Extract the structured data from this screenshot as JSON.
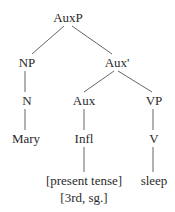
{
  "tree": {
    "nodes": [
      {
        "id": "auxp",
        "label": "AuxP",
        "x": 68,
        "y": 10
      },
      {
        "id": "np",
        "label": "NP",
        "x": 27,
        "y": 55
      },
      {
        "id": "auxbar",
        "label": "Aux'",
        "x": 117,
        "y": 55
      },
      {
        "id": "n",
        "label": "N",
        "x": 27,
        "y": 93
      },
      {
        "id": "aux",
        "label": "Aux",
        "x": 84,
        "y": 93
      },
      {
        "id": "vp",
        "label": "VP",
        "x": 154,
        "y": 93
      },
      {
        "id": "mary",
        "label": "Mary",
        "x": 26,
        "y": 131
      },
      {
        "id": "infl",
        "label": "Infl",
        "x": 84,
        "y": 131
      },
      {
        "id": "v",
        "label": "V",
        "x": 154,
        "y": 131
      },
      {
        "id": "tense",
        "label": "[present tense]",
        "x": 84,
        "y": 173
      },
      {
        "id": "agr",
        "label": "[3rd, sg.]",
        "x": 84,
        "y": 190
      },
      {
        "id": "sleep",
        "label": "sleep",
        "x": 154,
        "y": 173
      }
    ],
    "edges": [
      {
        "from": "auxp",
        "to": "np",
        "x1": 64,
        "y1": 26,
        "x2": 32,
        "y2": 54
      },
      {
        "from": "auxp",
        "to": "auxbar",
        "x1": 72,
        "y1": 26,
        "x2": 112,
        "y2": 54
      },
      {
        "from": "np",
        "to": "n",
        "x1": 25,
        "y1": 71,
        "x2": 25,
        "y2": 92
      },
      {
        "from": "auxbar",
        "to": "aux",
        "x1": 114,
        "y1": 71,
        "x2": 84,
        "y2": 92
      },
      {
        "from": "auxbar",
        "to": "vp",
        "x1": 118,
        "y1": 71,
        "x2": 152,
        "y2": 92
      },
      {
        "from": "n",
        "to": "mary",
        "x1": 25,
        "y1": 109,
        "x2": 25,
        "y2": 130
      },
      {
        "from": "aux",
        "to": "infl",
        "x1": 84,
        "y1": 109,
        "x2": 84,
        "y2": 130
      },
      {
        "from": "vp",
        "to": "v",
        "x1": 153,
        "y1": 109,
        "x2": 153,
        "y2": 130
      },
      {
        "from": "infl",
        "to": "tense",
        "x1": 84,
        "y1": 147,
        "x2": 84,
        "y2": 172
      },
      {
        "from": "v",
        "to": "sleep",
        "x1": 153,
        "y1": 147,
        "x2": 153,
        "y2": 172
      }
    ]
  }
}
